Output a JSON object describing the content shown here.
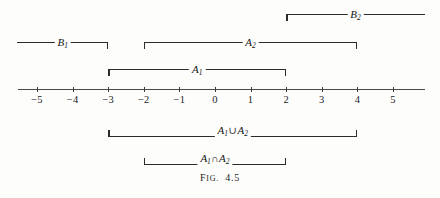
{
  "figure": {
    "caption_prefix": "F",
    "caption_smallcaps": "IG.",
    "caption_number": "4.5",
    "caption_full": "FIG. 4.5"
  },
  "axis": {
    "name": "real-number-line",
    "origin_px": 215,
    "unit_px": 35.6,
    "y_px": 89,
    "x_start_px": 18,
    "x_end_px": 425,
    "ticks": [
      {
        "value": -5,
        "label": "−5"
      },
      {
        "value": -4,
        "label": "−4"
      },
      {
        "value": -3,
        "label": "−3"
      },
      {
        "value": -2,
        "label": "−2"
      },
      {
        "value": -1,
        "label": "−1"
      },
      {
        "value": 0,
        "label": "0"
      },
      {
        "value": 1,
        "label": "1"
      },
      {
        "value": 2,
        "label": "2"
      },
      {
        "value": 3,
        "label": "3"
      },
      {
        "value": 4,
        "label": "4"
      },
      {
        "value": 5,
        "label": "5"
      }
    ]
  },
  "intervals": [
    {
      "id": "B2",
      "name": "interval-b2",
      "label_base": "B",
      "label_sub": "2",
      "label_op": "",
      "label_base2": "",
      "label_sub2": "",
      "start": 2,
      "end": 5.9,
      "start_closed": true,
      "end_closed": false,
      "bracket_direction": "down",
      "row_y": 14
    },
    {
      "id": "B1",
      "name": "interval-b1",
      "label_base": "B",
      "label_sub": "1",
      "label_op": "",
      "label_base2": "",
      "label_sub2": "",
      "start": -5.55,
      "end": -3,
      "start_closed": false,
      "end_closed": true,
      "bracket_direction": "down",
      "row_y": 42
    },
    {
      "id": "A2",
      "name": "interval-a2",
      "label_base": "A",
      "label_sub": "2",
      "label_op": "",
      "label_base2": "",
      "label_sub2": "",
      "start": -2,
      "end": 4,
      "start_closed": true,
      "end_closed": true,
      "bracket_direction": "down",
      "row_y": 42
    },
    {
      "id": "A1",
      "name": "interval-a1",
      "label_base": "A",
      "label_sub": "1",
      "label_op": "",
      "label_base2": "",
      "label_sub2": "",
      "start": -3,
      "end": 2,
      "start_closed": true,
      "end_closed": true,
      "bracket_direction": "down",
      "row_y": 69
    },
    {
      "id": "A1unionA2",
      "name": "interval-a1-union-a2",
      "label_base": "A",
      "label_sub": "1",
      "label_op": "∪",
      "label_base2": "A",
      "label_sub2": "2",
      "start": -3,
      "end": 4,
      "start_closed": true,
      "end_closed": true,
      "bracket_direction": "up",
      "row_y": 123
    },
    {
      "id": "A1intersectA2",
      "name": "interval-a1-intersect-a2",
      "label_base": "A",
      "label_sub": "1",
      "label_op": "∩",
      "label_base2": "A",
      "label_sub2": "2",
      "start": -2,
      "end": 2,
      "start_closed": true,
      "end_closed": true,
      "bracket_direction": "up",
      "row_y": 151
    }
  ],
  "colors": {
    "ink": "#2b2b2b",
    "axis": "#4a4a4a",
    "paper": "#fdfdfc"
  }
}
